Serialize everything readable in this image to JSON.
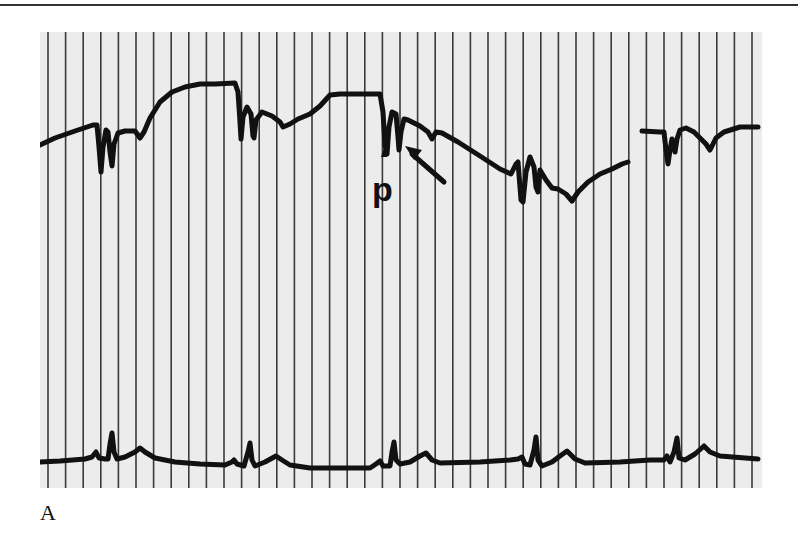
{
  "figure": {
    "panel_label": "A",
    "annotation_label": "p",
    "grid": {
      "vertical_line_count": 41,
      "spacing_px": 17.6,
      "line_color": "#3a3a3a",
      "background_color": "#ececec"
    },
    "traces": {
      "upper": {
        "name": "upper-waveform",
        "color": "#111111",
        "notes": "Baseline rises to a plateau, with paired sharp downward deflections; there is a gap near the right end."
      },
      "lower": {
        "name": "ecg-trace",
        "color": "#111111",
        "beats": 5,
        "notes": "Each beat shows a small P wave, a narrow QRS spike and a broad T wave."
      }
    }
  }
}
